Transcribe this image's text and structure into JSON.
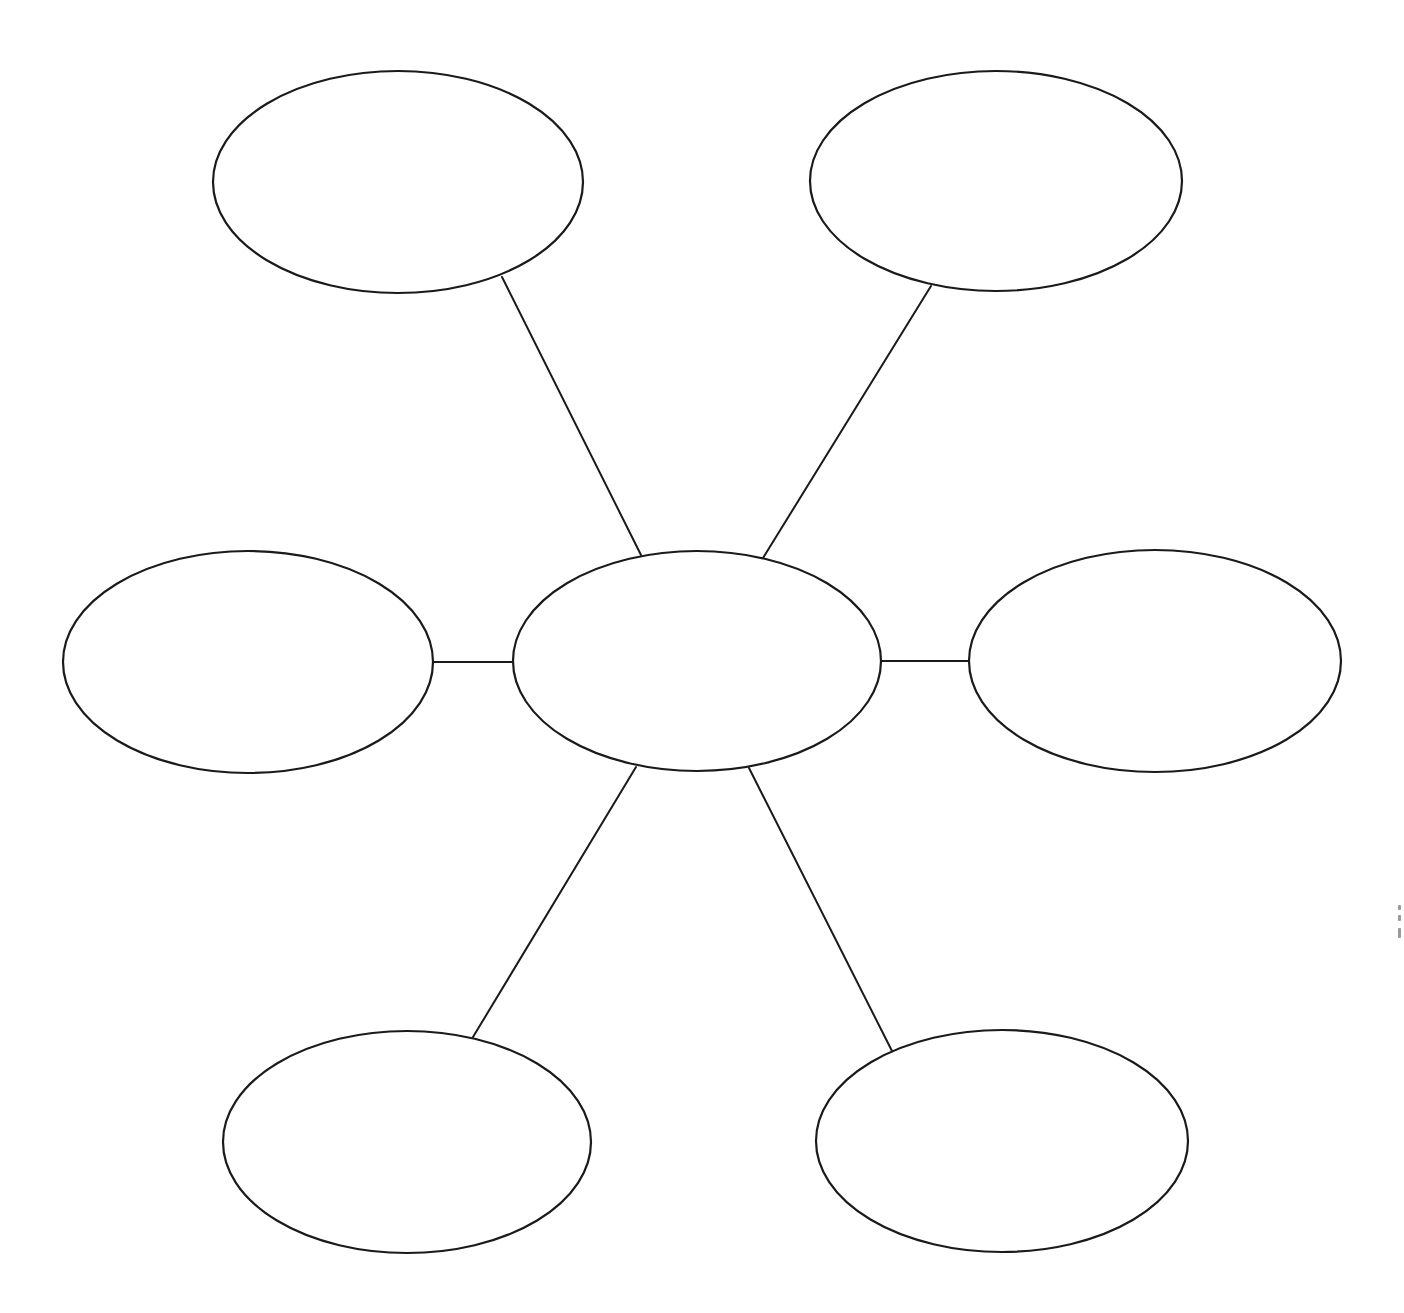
{
  "diagram": {
    "type": "spider-map-graphic-organizer",
    "stroke_color": "#1a1a1a",
    "background_color": "#ffffff",
    "center": {
      "id": "center",
      "cx": 697,
      "cy": 661,
      "rx": 184,
      "ry": 110,
      "label": ""
    },
    "branches": [
      {
        "id": "top-left",
        "cx": 398,
        "cy": 182,
        "rx": 185,
        "ry": 111,
        "label": "",
        "connector": {
          "x1": 502,
          "y1": 277,
          "x2": 641,
          "y2": 555
        }
      },
      {
        "id": "top-right",
        "cx": 996,
        "cy": 181,
        "rx": 186,
        "ry": 110,
        "label": "",
        "connector": {
          "x1": 931,
          "y1": 286,
          "x2": 763,
          "y2": 558
        }
      },
      {
        "id": "middle-left",
        "cx": 248,
        "cy": 662,
        "rx": 185,
        "ry": 111,
        "label": "",
        "connector": {
          "x1": 434,
          "y1": 662,
          "x2": 513,
          "y2": 662
        }
      },
      {
        "id": "middle-right",
        "cx": 1155,
        "cy": 661,
        "rx": 186,
        "ry": 111,
        "label": "",
        "connector": {
          "x1": 882,
          "y1": 661,
          "x2": 969,
          "y2": 661
        }
      },
      {
        "id": "bottom-left",
        "cx": 407,
        "cy": 1142,
        "rx": 184,
        "ry": 111,
        "label": "",
        "connector": {
          "x1": 636,
          "y1": 767,
          "x2": 473,
          "y2": 1037
        }
      },
      {
        "id": "bottom-right",
        "cx": 1002,
        "cy": 1141,
        "rx": 186,
        "ry": 111,
        "label": "",
        "connector": {
          "x1": 749,
          "y1": 768,
          "x2": 892,
          "y2": 1051
        }
      }
    ]
  }
}
